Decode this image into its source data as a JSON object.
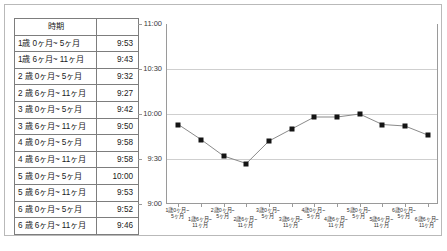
{
  "table": {
    "headers": [
      "時期",
      ""
    ],
    "rows": [
      {
        "period": "1歳 0ヶ月~ 5ヶ月",
        "value": "9:53"
      },
      {
        "period": "1歳 6ヶ月~ 11ヶ月",
        "value": "9:43"
      },
      {
        "period": "2 歳 0ヶ月~ 5ヶ月",
        "value": "9:32"
      },
      {
        "period": "2 歳 6ヶ月~ 11ヶ月",
        "value": "9:27"
      },
      {
        "period": "3 歳 0ヶ月~ 5ヶ月",
        "value": "9:42"
      },
      {
        "period": "3 歳 6ヶ月~ 11ヶ月",
        "value": "9:50"
      },
      {
        "period": "4 歳 0ヶ月~ 5ヶ月",
        "value": "9:58"
      },
      {
        "period": "4 歳 6ヶ月~ 11ヶ月",
        "value": "9:58"
      },
      {
        "period": "5 歳 0ヶ月~ 5ヶ月",
        "value": "10:00"
      },
      {
        "period": "5 歳 6ヶ月~ 11ヶ月",
        "value": "9:53"
      },
      {
        "period": "6 歳 0ヶ月~ 5ヶ月",
        "value": "9:52"
      },
      {
        "period": "6 歳 6ヶ月~ 11ヶ月",
        "value": "9:46"
      }
    ]
  },
  "chart_data": {
    "type": "line",
    "title": "",
    "xlabel": "",
    "ylabel": "",
    "grid": true,
    "legend": "none",
    "categories": [
      "1歳0ヶ月~\n5ヶ月",
      "1歳6ヶ月~\n11ヶ月",
      "2歳0ヶ月~\n5ヶ月",
      "2歳6ヶ月~\n11ヶ月",
      "3歳0ヶ月~\n5ヶ月",
      "3歳6ヶ月~\n11ヶ月",
      "4歳0ヶ月~\n5ヶ月",
      "4歳6ヶ月~\n11ヶ月",
      "5歳0ヶ月~\n5ヶ月",
      "5歳6ヶ月~\n11ヶ月",
      "6歳0ヶ月~\n5ヶ月",
      "6歳6ヶ月~\n11ヶ月"
    ],
    "values": [
      "9:53",
      "9:43",
      "9:32",
      "9:27",
      "9:42",
      "9:50",
      "9:58",
      "9:58",
      "10:00",
      "9:53",
      "9:52",
      "9:46"
    ],
    "values_minutes": [
      593,
      583,
      572,
      567,
      582,
      590,
      598,
      598,
      600,
      593,
      592,
      586
    ],
    "ytick_labels": [
      "11:00",
      "10:30",
      "10:00",
      "9:30",
      "9:00"
    ],
    "ytick_minutes": [
      660,
      630,
      600,
      570,
      540
    ],
    "ylim_minutes": [
      540,
      660
    ],
    "marker": "square",
    "marker_color": "#141414",
    "line_color": "#8a8a8a"
  }
}
